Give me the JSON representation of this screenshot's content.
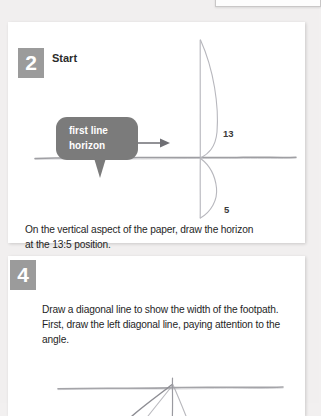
{
  "page": {
    "background_color": "#f1efef"
  },
  "panels": [
    {
      "step_number": "2",
      "title": "Start",
      "caption": "On the vertical aspect of the paper, draw the horizon at the 13:5 position.",
      "annotation": {
        "bubble_text": "first line\nhorizon",
        "bubble_color": "#7b7b7b",
        "arrow": "right-arrow"
      },
      "measurements": [
        {
          "label": "13",
          "position": "above-horizon"
        },
        {
          "label": "5",
          "position": "below-horizon"
        }
      ],
      "drawing": {
        "type": "perspective-sketch",
        "elements": [
          "horizon-line",
          "vertical-line",
          "upper-brace",
          "lower-brace"
        ]
      }
    },
    {
      "step_number": "4",
      "title": "",
      "caption": "Draw a diagonal line to show the width of the footpath. First, draw the left diagonal line, paying attention to the angle.",
      "drawing": {
        "type": "perspective-sketch",
        "elements": [
          "horizon-line",
          "left-diagonal-line",
          "right-diagonal-line",
          "vertical-line"
        ]
      }
    }
  ],
  "colors": {
    "badge": "#9b9b9b",
    "badge_text": "#ffffff",
    "panel": "#ffffff",
    "pencil": "#8c8c90"
  }
}
